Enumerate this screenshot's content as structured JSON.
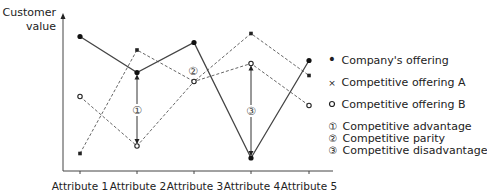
{
  "chart_data": {
    "type": "line",
    "title": "",
    "xlabel": "",
    "ylabel": "Customer value",
    "categories": [
      "Attribute 1",
      "Attribute 2",
      "Attribute 3",
      "Attribute 4",
      "Attribute 5"
    ],
    "ylim": [
      0,
      10
    ],
    "grid": false,
    "legend_position": "right",
    "series": [
      {
        "name": "Company's offering",
        "style": "solid",
        "marker": "dot",
        "values": [
          8.9,
          6.5,
          8.5,
          0.8,
          7.3
        ]
      },
      {
        "name": "Competitive offering A",
        "style": "dashed",
        "marker": "x",
        "values": [
          1.1,
          8.0,
          5.9,
          9.1,
          6.3
        ]
      },
      {
        "name": "Competitive offering B",
        "style": "dashed",
        "marker": "circle",
        "values": [
          4.9,
          1.6,
          5.9,
          7.1,
          4.3
        ]
      }
    ],
    "annotations": [
      {
        "id": "1",
        "symbol": "①",
        "label": "Competitive advantage",
        "category": "Attribute 2"
      },
      {
        "id": "2",
        "symbol": "②",
        "label": "Competitive parity",
        "category": "Attribute 3"
      },
      {
        "id": "3",
        "symbol": "③",
        "label": "Competitive disadvantage",
        "category": "Attribute 4"
      }
    ]
  },
  "axis": {
    "ylabel_line1": "Customer",
    "ylabel_line2": "value",
    "xlabels": [
      "Attribute 1",
      "Attribute 2",
      "Attribute 3",
      "Attribute 4",
      "Attribute 5"
    ]
  },
  "legend": {
    "items": [
      {
        "marker": "•",
        "label": "Company's offering"
      },
      {
        "marker": "×",
        "label": "Competitive offering A"
      },
      {
        "marker": "•",
        "label": "Competitive offering B"
      }
    ]
  },
  "notes": [
    {
      "symbol": "①",
      "label": "Competitive advantage"
    },
    {
      "symbol": "②",
      "label": "Competitive parity"
    },
    {
      "symbol": "③",
      "label": "Competitive disadvantage"
    }
  ]
}
